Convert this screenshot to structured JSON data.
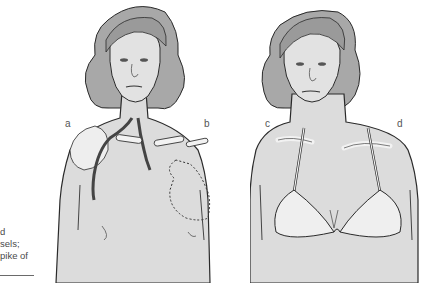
{
  "caption_fragment": {
    "lines": [
      "d",
      "sels;",
      "pike of"
    ]
  },
  "figure": {
    "panels": [
      {
        "id": "left",
        "description": "woman's torso with shoulder joint, subclavian vessels and dashed outline of heart",
        "labels": [
          "a",
          "b"
        ]
      },
      {
        "id": "right",
        "description": "woman's torso wearing lace bra with straps over clavicles",
        "labels": [
          "c",
          "d"
        ]
      }
    ],
    "labels": {
      "a": "a",
      "b": "b",
      "c": "c",
      "d": "d"
    }
  },
  "colors": {
    "skin": "#dcdcdc",
    "hair": "#a8a8a8",
    "outline": "#2a2a2a",
    "bra": "#efefef"
  }
}
